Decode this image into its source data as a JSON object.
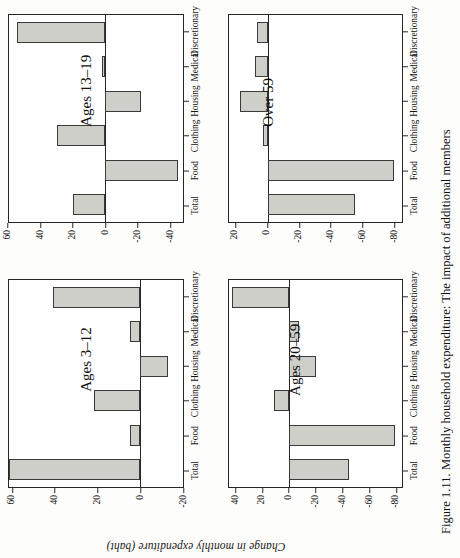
{
  "figure": {
    "caption": "Figure 1.11. Monthly household expenditure: The impact of additional members",
    "ylabel": "Change in monthly expenditure (baht)",
    "bar_fill": "#cfcfca",
    "bar_stroke": "#3a3a3a"
  },
  "chart_data": [
    {
      "type": "bar",
      "title": "Ages 3–12",
      "categories": [
        "Total",
        "Food",
        "Clothing",
        "Housing",
        "Medical",
        "Discretionary"
      ],
      "values": [
        62,
        5,
        22,
        -13,
        5,
        41
      ],
      "xlabel": "",
      "ylabel": "Change in monthly expenditure (baht)",
      "ylim": [
        -20,
        62
      ],
      "yticks": [
        60,
        40,
        20,
        0,
        -20
      ],
      "grid": false,
      "legend": "none"
    },
    {
      "type": "bar",
      "title": "Ages 13–19",
      "categories": [
        "Total",
        "Food",
        "Clothing",
        "Housing",
        "Medical",
        "Discretionary"
      ],
      "values": [
        20,
        -45,
        30,
        -22,
        2,
        55
      ],
      "xlabel": "",
      "ylabel": "Change in monthly expenditure (baht)",
      "ylim": [
        -48,
        60
      ],
      "yticks": [
        60,
        40,
        20,
        0,
        -20,
        -40
      ],
      "grid": false,
      "legend": "none"
    },
    {
      "type": "bar",
      "title": "Ages 20–59",
      "categories": [
        "Total",
        "Food",
        "Clothing",
        "Housing",
        "Medical",
        "Discretionary"
      ],
      "values": [
        -45,
        -80,
        12,
        -20,
        -7,
        43
      ],
      "xlabel": "",
      "ylabel": "Change in monthly expenditure (baht)",
      "ylim": [
        -85,
        46
      ],
      "yticks": [
        40,
        20,
        0,
        -20,
        -40,
        -60,
        -80
      ],
      "grid": false,
      "legend": "none"
    },
    {
      "type": "bar",
      "title": "Over 59",
      "categories": [
        "Total",
        "Food",
        "Clothing",
        "Housing",
        "Medical",
        "Discretionary"
      ],
      "values": [
        -55,
        -80,
        3,
        18,
        8,
        7
      ],
      "xlabel": "",
      "ylabel": "Change in monthly expenditure (baht)",
      "ylim": [
        -85,
        25
      ],
      "yticks": [
        20,
        0,
        -20,
        -40,
        -60,
        -80
      ],
      "grid": false,
      "legend": "none"
    }
  ]
}
